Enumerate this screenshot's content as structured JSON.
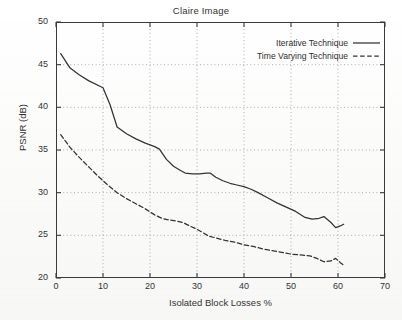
{
  "chart_data": {
    "type": "line",
    "title": "Claire Image",
    "xlabel": "Isolated Block Losses %",
    "ylabel": "PSNR (dB)",
    "xlim": [
      0,
      70
    ],
    "ylim": [
      20,
      50
    ],
    "xticks": [
      0,
      10,
      20,
      30,
      40,
      50,
      60,
      70
    ],
    "yticks": [
      20,
      25,
      30,
      35,
      40,
      45,
      50
    ],
    "grid": true,
    "legend_position": "top-right inside",
    "series": [
      {
        "name": "Iterative Technique",
        "style": "solid",
        "color": "#333333",
        "x": [
          1.0,
          3.0,
          5.0,
          7.0,
          10.0,
          11.5,
          13.0,
          15.0,
          17.0,
          19.0,
          21.0,
          22.0,
          23.5,
          25.0,
          26.5,
          27.5,
          29.0,
          30.5,
          32.0,
          32.8,
          34.0,
          35.5,
          37.0,
          38.5,
          40.0,
          41.5,
          43.0,
          45.0,
          47.0,
          49.0,
          51.0,
          53.0,
          54.5,
          56.0,
          57.0,
          58.5,
          59.5,
          60.5,
          61.2
        ],
        "y": [
          46.3,
          44.6,
          43.8,
          43.1,
          42.3,
          40.3,
          37.7,
          36.9,
          36.3,
          35.8,
          35.4,
          35.1,
          33.9,
          33.1,
          32.6,
          32.3,
          32.2,
          32.2,
          32.3,
          32.3,
          31.8,
          31.4,
          31.1,
          30.9,
          30.7,
          30.4,
          30.0,
          29.4,
          28.8,
          28.3,
          27.8,
          27.1,
          26.9,
          27.0,
          27.2,
          26.5,
          25.9,
          26.1,
          26.3
        ]
      },
      {
        "name": "Time Varying Technique",
        "style": "dashed",
        "color": "#333333",
        "x": [
          1.0,
          3.0,
          5.0,
          7.0,
          9.0,
          11.0,
          13.0,
          15.0,
          17.0,
          19.0,
          21.0,
          22.5,
          24.0,
          25.5,
          27.0,
          28.5,
          30.0,
          31.0,
          32.5,
          34.0,
          36.0,
          38.0,
          40.0,
          42.0,
          44.0,
          46.0,
          48.0,
          50.0,
          52.0,
          54.0,
          55.5,
          57.0,
          58.5,
          59.5,
          60.5,
          61.2
        ],
        "y": [
          36.8,
          35.3,
          34.1,
          33.0,
          31.9,
          30.9,
          30.0,
          29.3,
          28.7,
          28.1,
          27.4,
          27.0,
          26.8,
          26.7,
          26.5,
          26.1,
          25.7,
          25.4,
          24.9,
          24.7,
          24.4,
          24.2,
          23.9,
          23.7,
          23.4,
          23.2,
          23.0,
          22.8,
          22.7,
          22.6,
          22.3,
          21.9,
          22.0,
          22.3,
          21.8,
          21.5
        ]
      }
    ]
  }
}
